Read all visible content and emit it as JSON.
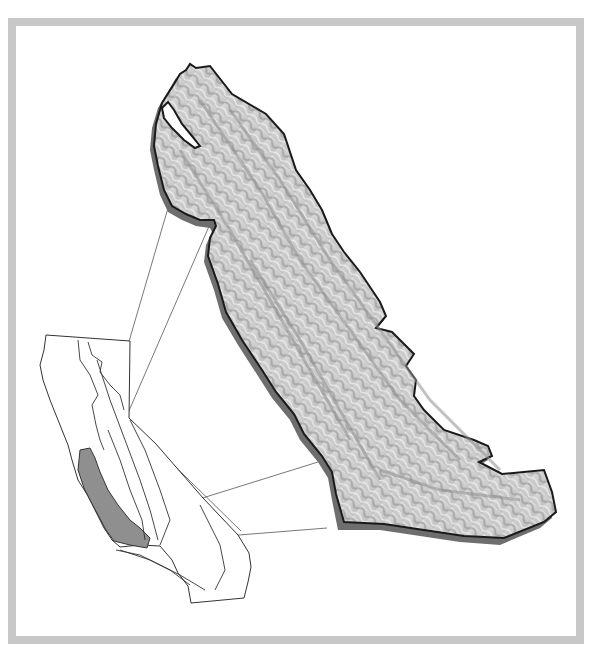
{
  "map": {
    "subject": "Central Coast Ranges relief with California locator inset",
    "colors": {
      "frame": "#c8c8c8",
      "background": "#ffffff",
      "region_highlight": "#8f8f8f",
      "shadow": "#6e6e6e",
      "outline": "#1a1a1a",
      "relief_light": "#e8e8e8",
      "relief_dark": "#8a8a8a",
      "leader_lines": "#555555"
    },
    "layers": [
      {
        "name": "main-relief-region",
        "description": "shaded relief map of the Coast Ranges region"
      },
      {
        "name": "california-inset",
        "description": "outline of California with geomorphic province boundaries"
      },
      {
        "name": "highlighted-province",
        "description": "Coast Ranges province shaded gray in inset"
      },
      {
        "name": "leader-lines",
        "count": 4,
        "description": "lines connecting inset region to enlarged relief"
      }
    ]
  }
}
